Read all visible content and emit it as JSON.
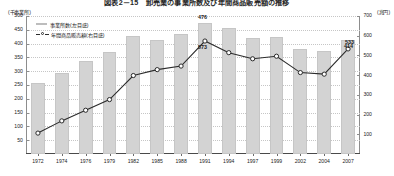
{
  "title": "図表2－15　卸売業の事業所数及び年間商品販売額の推移",
  "axis": {
    "left_unit": "(千事業所)",
    "right_unit": "(兆円)",
    "left_ticks": [
      "500",
      "450",
      "400",
      "350",
      "300",
      "250",
      "200",
      "150",
      "100",
      "50"
    ],
    "right_ticks": [
      "700",
      "600",
      "500",
      "400",
      "300",
      "200",
      "100"
    ],
    "left_min": 0,
    "left_max": 500,
    "right_min": 0,
    "right_max": 700
  },
  "legend": [
    {
      "label": "事業所数(左目盛)",
      "marker": "bar-swatch",
      "color": "#d3d3d3"
    },
    {
      "label": "年間商品販売額(右目盛)",
      "marker": "line-circle-marker",
      "color": "#2b2b2b"
    }
  ],
  "value_labels": [
    {
      "text": "476",
      "series": "事業所数",
      "year": "1991"
    },
    {
      "text": "573",
      "series": "年間商品販売額",
      "year": "1991"
    },
    {
      "text": "533",
      "series": "年間商品販売額",
      "year": "2007"
    },
    {
      "text": "414",
      "series": "事業所数",
      "year": "2007"
    }
  ],
  "chart_data": {
    "type": "bar",
    "title": "図表2－15　卸売業の事業所数及び年間商品販売額の推移",
    "xlabel": "",
    "ylabel": "(千事業所)",
    "y2label": "(兆円)",
    "categories": [
      "1972",
      "1974",
      "1976",
      "1979",
      "1982",
      "1985",
      "1988",
      "1991",
      "1994",
      "1997",
      "1999",
      "2002",
      "2004",
      "2007"
    ],
    "ylim": [
      0,
      500
    ],
    "y2lim": [
      0,
      700
    ],
    "grid": true,
    "legend_position": "upper-left",
    "series": [
      {
        "name": "事業所数(左目盛)",
        "type": "bar",
        "axis": "left",
        "unit": "千事業所",
        "color": "#d3d3d3",
        "values": [
          257,
          293,
          336,
          369,
          429,
          413,
          436,
          476,
          457,
          420,
          425,
          379,
          375,
          414
        ]
      },
      {
        "name": "年間商品販売額(右目盛)",
        "type": "line",
        "axis": "right",
        "unit": "兆円",
        "color": "#2b2b2b",
        "values": [
          106,
          168,
          222,
          276,
          398,
          428,
          446,
          573,
          514,
          483,
          496,
          413,
          405,
          533
        ]
      }
    ]
  }
}
